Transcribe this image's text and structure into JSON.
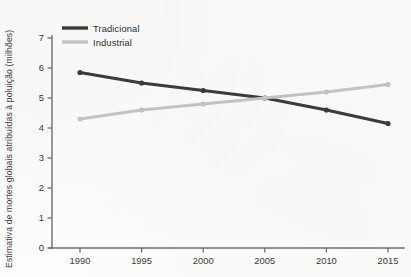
{
  "chart_data": {
    "type": "line",
    "title": "",
    "xlabel": "",
    "ylabel": "Estimativa de mortes globais atribuídas à poluição (milhões)",
    "x": [
      1990,
      1995,
      2000,
      2005,
      2010,
      2015
    ],
    "xtick_labels": [
      "1990",
      "1995",
      "2000",
      "2005",
      "2010",
      "2015"
    ],
    "ytick_labels": [
      "0",
      "1",
      "2",
      "3",
      "4",
      "5",
      "6",
      "7"
    ],
    "yticks": [
      0,
      1,
      2,
      3,
      4,
      5,
      6,
      7
    ],
    "ylim": [
      0,
      7
    ],
    "xlim": [
      1988.2,
      2015.8
    ],
    "grid": false,
    "legend_position": "top-left",
    "series": [
      {
        "name": "Tradicional",
        "color": "#3b3b3b",
        "values": [
          5.85,
          5.5,
          5.25,
          5.0,
          4.6,
          4.15
        ]
      },
      {
        "name": "Industrial",
        "color": "#c2c2c2",
        "values": [
          4.3,
          4.6,
          4.8,
          5.0,
          5.2,
          5.45
        ]
      }
    ]
  },
  "legend": {
    "items": [
      {
        "label": "Tradicional",
        "color": "#3b3b3b"
      },
      {
        "label": "Industrial",
        "color": "#c2c2c2"
      }
    ]
  },
  "axes": {
    "axis_color": "#6e6e6e",
    "y_axis_label": "Estimativa de mortes globais atribuídas à poluição (milhões)"
  }
}
